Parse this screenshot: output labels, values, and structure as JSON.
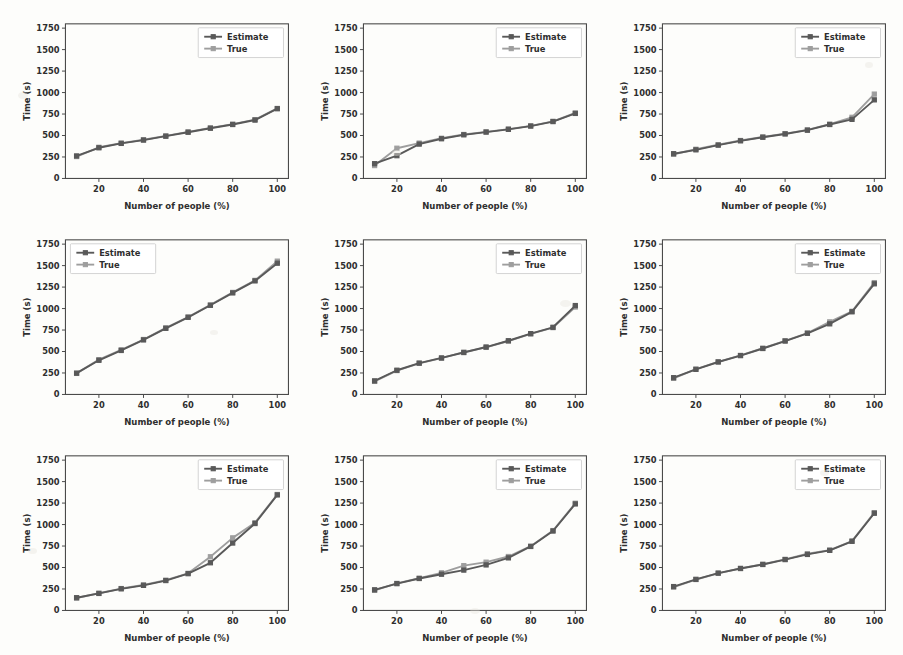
{
  "figure": {
    "background_color": "#fdfdfb",
    "rows": 3,
    "cols": 3,
    "panel_count": 9
  },
  "axis": {
    "xlabel": "Number of people (%)",
    "ylabel": "Time (s)",
    "x_ticks": [
      "20",
      "40",
      "60",
      "80",
      "100"
    ],
    "y_ticks": [
      "0",
      "250",
      "500",
      "750",
      "1000",
      "1250",
      "1500",
      "1750"
    ]
  },
  "legend": {
    "estimate_label": "Estimate",
    "true_label": "True",
    "estimate_color": "#595959",
    "true_color": "#9e9e9e",
    "position_default": "upper-right",
    "position_panel4": "upper-left"
  },
  "chart_data": [
    {
      "type": "line",
      "title": "",
      "xlabel": "Number of people (%)",
      "ylabel": "Time (s)",
      "xlim": [
        5,
        105
      ],
      "ylim": [
        0,
        1800
      ],
      "xticks": [
        20,
        40,
        60,
        80,
        100
      ],
      "yticks": [
        0,
        250,
        500,
        750,
        1000,
        1250,
        1500,
        1750
      ],
      "grid": false,
      "legend_position": "upper-right",
      "x": [
        10,
        20,
        30,
        40,
        50,
        60,
        70,
        80,
        90,
        100
      ],
      "series": [
        {
          "name": "Estimate",
          "color": "#595959",
          "values": [
            262,
            357,
            408,
            447,
            492,
            538,
            585,
            628,
            680,
            812
          ]
        },
        {
          "name": "True",
          "color": "#9e9e9e",
          "values": [
            255,
            363,
            412,
            450,
            495,
            542,
            588,
            632,
            684,
            815
          ]
        }
      ]
    },
    {
      "type": "line",
      "title": "",
      "xlabel": "Number of people (%)",
      "ylabel": "Time (s)",
      "xlim": [
        5,
        105
      ],
      "ylim": [
        0,
        1800
      ],
      "xticks": [
        20,
        40,
        60,
        80,
        100
      ],
      "yticks": [
        0,
        250,
        500,
        750,
        1000,
        1250,
        1500,
        1750
      ],
      "grid": false,
      "legend_position": "upper-right",
      "x": [
        10,
        20,
        30,
        40,
        50,
        60,
        70,
        80,
        90,
        100
      ],
      "series": [
        {
          "name": "Estimate",
          "color": "#595959",
          "values": [
            172,
            265,
            400,
            462,
            508,
            540,
            572,
            610,
            662,
            757
          ]
        },
        {
          "name": "True",
          "color": "#9e9e9e",
          "values": [
            150,
            352,
            412,
            468,
            512,
            542,
            575,
            612,
            665,
            762
          ]
        }
      ]
    },
    {
      "type": "line",
      "title": "",
      "xlabel": "Number of people (%)",
      "ylabel": "Time (s)",
      "xlim": [
        5,
        105
      ],
      "ylim": [
        0,
        1800
      ],
      "xticks": [
        20,
        40,
        60,
        80,
        100
      ],
      "yticks": [
        0,
        250,
        500,
        750,
        1000,
        1250,
        1500,
        1750
      ],
      "grid": false,
      "legend_position": "upper-right",
      "x": [
        10,
        20,
        30,
        40,
        50,
        60,
        70,
        80,
        90,
        100
      ],
      "series": [
        {
          "name": "Estimate",
          "color": "#595959",
          "values": [
            288,
            333,
            388,
            438,
            480,
            518,
            562,
            628,
            688,
            915
          ]
        },
        {
          "name": "True",
          "color": "#9e9e9e",
          "values": [
            282,
            340,
            392,
            442,
            483,
            522,
            565,
            632,
            712,
            982
          ]
        }
      ]
    },
    {
      "type": "line",
      "title": "",
      "xlabel": "Number of people (%)",
      "ylabel": "Time (s)",
      "xlim": [
        5,
        105
      ],
      "ylim": [
        0,
        1800
      ],
      "xticks": [
        20,
        40,
        60,
        80,
        100
      ],
      "yticks": [
        0,
        250,
        500,
        750,
        1000,
        1250,
        1500,
        1750
      ],
      "grid": false,
      "legend_position": "upper-left",
      "x": [
        10,
        20,
        30,
        40,
        50,
        60,
        70,
        80,
        90,
        100
      ],
      "series": [
        {
          "name": "Estimate",
          "color": "#595959",
          "values": [
            248,
            398,
            512,
            635,
            770,
            898,
            1038,
            1182,
            1322,
            1528
          ]
        },
        {
          "name": "True",
          "color": "#9e9e9e",
          "values": [
            245,
            405,
            520,
            640,
            775,
            902,
            1042,
            1188,
            1328,
            1552
          ]
        }
      ]
    },
    {
      "type": "line",
      "title": "",
      "xlabel": "Number of people (%)",
      "ylabel": "Time (s)",
      "xlim": [
        5,
        105
      ],
      "ylim": [
        0,
        1800
      ],
      "xticks": [
        20,
        40,
        60,
        80,
        100
      ],
      "yticks": [
        0,
        250,
        500,
        750,
        1000,
        1250,
        1500,
        1750
      ],
      "grid": false,
      "legend_position": "upper-right",
      "x": [
        10,
        20,
        30,
        40,
        50,
        60,
        70,
        80,
        90,
        100
      ],
      "series": [
        {
          "name": "Estimate",
          "color": "#595959",
          "values": [
            158,
            282,
            365,
            425,
            488,
            552,
            625,
            708,
            782,
            1035
          ]
        },
        {
          "name": "True",
          "color": "#9e9e9e",
          "values": [
            152,
            278,
            362,
            422,
            492,
            548,
            622,
            705,
            778,
            1018
          ]
        }
      ]
    },
    {
      "type": "line",
      "title": "",
      "xlabel": "Number of people (%)",
      "ylabel": "Time (s)",
      "xlim": [
        5,
        105
      ],
      "ylim": [
        0,
        1800
      ],
      "xticks": [
        20,
        40,
        60,
        80,
        100
      ],
      "yticks": [
        0,
        250,
        500,
        750,
        1000,
        1250,
        1500,
        1750
      ],
      "grid": false,
      "legend_position": "upper-right",
      "x": [
        10,
        20,
        30,
        40,
        50,
        60,
        70,
        80,
        90,
        100
      ],
      "series": [
        {
          "name": "Estimate",
          "color": "#595959",
          "values": [
            195,
            292,
            378,
            452,
            535,
            622,
            712,
            822,
            962,
            1288
          ]
        },
        {
          "name": "True",
          "color": "#9e9e9e",
          "values": [
            188,
            295,
            380,
            455,
            538,
            625,
            715,
            845,
            968,
            1302
          ]
        }
      ]
    },
    {
      "type": "line",
      "title": "",
      "xlabel": "Number of people (%)",
      "ylabel": "Time (s)",
      "xlim": [
        5,
        105
      ],
      "ylim": [
        0,
        1800
      ],
      "xticks": [
        20,
        40,
        60,
        80,
        100
      ],
      "yticks": [
        0,
        250,
        500,
        750,
        1000,
        1250,
        1500,
        1750
      ],
      "grid": false,
      "legend_position": "upper-right",
      "x": [
        10,
        20,
        30,
        40,
        50,
        60,
        70,
        80,
        90,
        100
      ],
      "series": [
        {
          "name": "Estimate",
          "color": "#595959",
          "values": [
            148,
            198,
            252,
            292,
            348,
            428,
            555,
            785,
            1012,
            1345
          ]
        },
        {
          "name": "True",
          "color": "#9e9e9e",
          "values": [
            145,
            200,
            255,
            298,
            352,
            432,
            625,
            845,
            1022,
            1350
          ]
        }
      ]
    },
    {
      "type": "line",
      "title": "",
      "xlabel": "Number of people (%)",
      "ylabel": "Time (s)",
      "xlim": [
        5,
        105
      ],
      "ylim": [
        0,
        1800
      ],
      "xticks": [
        20,
        40,
        60,
        80,
        100
      ],
      "yticks": [
        0,
        250,
        500,
        750,
        1000,
        1250,
        1500,
        1750
      ],
      "grid": false,
      "legend_position": "upper-right",
      "x": [
        10,
        20,
        30,
        40,
        50,
        60,
        70,
        80,
        90,
        100
      ],
      "series": [
        {
          "name": "Estimate",
          "color": "#595959",
          "values": [
            240,
            312,
            372,
            422,
            470,
            530,
            612,
            745,
            925,
            1240
          ]
        },
        {
          "name": "True",
          "color": "#9e9e9e",
          "values": [
            235,
            315,
            375,
            438,
            522,
            562,
            628,
            748,
            930,
            1248
          ]
        }
      ]
    },
    {
      "type": "line",
      "title": "",
      "xlabel": "Number of people (%)",
      "ylabel": "Time (s)",
      "xlim": [
        5,
        105
      ],
      "ylim": [
        0,
        1800
      ],
      "xticks": [
        20,
        40,
        60,
        80,
        100
      ],
      "yticks": [
        0,
        250,
        500,
        750,
        1000,
        1250,
        1500,
        1750
      ],
      "grid": false,
      "legend_position": "upper-right",
      "x": [
        10,
        20,
        30,
        40,
        50,
        60,
        70,
        80,
        90,
        100
      ],
      "series": [
        {
          "name": "Estimate",
          "color": "#595959",
          "values": [
            278,
            362,
            435,
            488,
            535,
            592,
            652,
            700,
            805,
            1132
          ]
        },
        {
          "name": "True",
          "color": "#9e9e9e",
          "values": [
            272,
            360,
            432,
            490,
            538,
            595,
            660,
            702,
            808,
            1138
          ]
        }
      ]
    }
  ]
}
